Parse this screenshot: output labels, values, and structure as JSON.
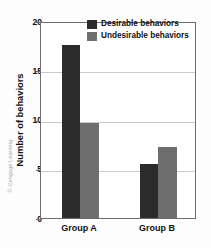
{
  "credit": "© Cengage Learning",
  "legend": {
    "items": [
      {
        "label": "Desirable behaviors",
        "color": "#2b2b2b",
        "swatch_name": "legend-swatch-desirable"
      },
      {
        "label": "Undesirable behaviors",
        "color": "#6e6e6e",
        "swatch_name": "legend-swatch-undesirable"
      }
    ]
  },
  "chart_data": {
    "type": "bar",
    "title": "",
    "xlabel": "",
    "ylabel": "Number of behaviors",
    "categories": [
      "Group A",
      "Group B"
    ],
    "series": [
      {
        "name": "Desirable behaviors",
        "color": "#2b2b2b",
        "values": [
          17.6,
          5.5
        ]
      },
      {
        "name": "Undesirable behaviors",
        "color": "#6e6e6e",
        "values": [
          9.6,
          7.2
        ]
      }
    ],
    "ylim": [
      0,
      20
    ],
    "yticks": [
      0,
      5,
      10,
      15,
      20
    ],
    "ytick_labels": [
      "0",
      "5",
      "10",
      "15",
      "20"
    ],
    "grid": true,
    "grid_axis": "y",
    "legend_position": "top-right-inside"
  }
}
